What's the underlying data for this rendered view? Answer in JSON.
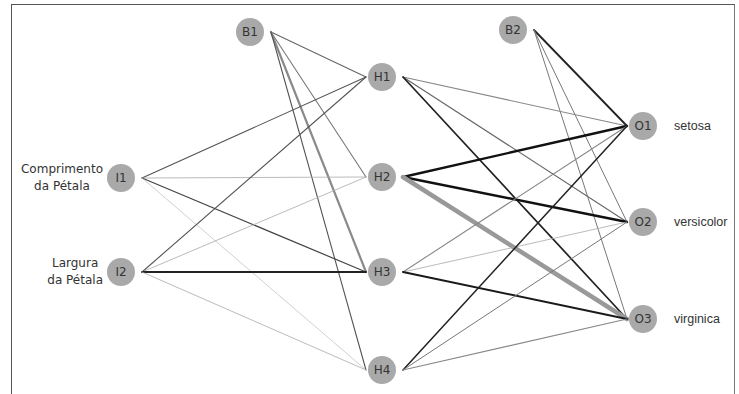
{
  "diagram": {
    "type": "neural-network",
    "nodes": {
      "B1": {
        "label": "B1",
        "x": 250,
        "y": 32
      },
      "B2": {
        "label": "B2",
        "x": 513,
        "y": 30
      },
      "I1": {
        "label": "I1",
        "x": 121,
        "y": 178
      },
      "I2": {
        "label": "I2",
        "x": 121,
        "y": 272
      },
      "H1": {
        "label": "H1",
        "x": 382,
        "y": 77
      },
      "H2": {
        "label": "H2",
        "x": 382,
        "y": 177
      },
      "H3": {
        "label": "H3",
        "x": 382,
        "y": 272
      },
      "H4": {
        "label": "H4",
        "x": 382,
        "y": 370
      },
      "O1": {
        "label": "O1",
        "x": 643,
        "y": 126
      },
      "O2": {
        "label": "O2",
        "x": 643,
        "y": 222
      },
      "O3": {
        "label": "O3",
        "x": 643,
        "y": 319
      }
    },
    "input_labels": {
      "I1": [
        "Comprimento",
        "da Pétala"
      ],
      "I2": [
        "Largura",
        "da Pétala"
      ]
    },
    "output_labels": {
      "O1": "setosa",
      "O2": "versicolor",
      "O3": "virginica"
    },
    "edges": [
      {
        "from": "B1",
        "to": "H1",
        "width": 1.1,
        "color": "#666666"
      },
      {
        "from": "B1",
        "to": "H2",
        "width": 1.1,
        "color": "#777777"
      },
      {
        "from": "B1",
        "to": "H3",
        "width": 2.2,
        "color": "#8a8a8a"
      },
      {
        "from": "B1",
        "to": "H4",
        "width": 1.1,
        "color": "#555555"
      },
      {
        "from": "I1",
        "to": "H1",
        "width": 1.1,
        "color": "#555555"
      },
      {
        "from": "I1",
        "to": "H2",
        "width": 0.8,
        "color": "#aaaaaa"
      },
      {
        "from": "I1",
        "to": "H3",
        "width": 1.2,
        "color": "#444444"
      },
      {
        "from": "I1",
        "to": "H4",
        "width": 0.7,
        "color": "#bbbbbb"
      },
      {
        "from": "I2",
        "to": "H1",
        "width": 1.1,
        "color": "#555555"
      },
      {
        "from": "I2",
        "to": "H2",
        "width": 0.8,
        "color": "#aaaaaa"
      },
      {
        "from": "I2",
        "to": "H3",
        "width": 1.8,
        "color": "#222222"
      },
      {
        "from": "I2",
        "to": "H4",
        "width": 0.8,
        "color": "#aaaaaa"
      },
      {
        "from": "B2",
        "to": "O1",
        "width": 1.8,
        "color": "#222222"
      },
      {
        "from": "B2",
        "to": "O2",
        "width": 1.0,
        "color": "#777777"
      },
      {
        "from": "B2",
        "to": "O3",
        "width": 1.0,
        "color": "#777777"
      },
      {
        "from": "H1",
        "to": "O1",
        "width": 1.1,
        "color": "#888888"
      },
      {
        "from": "H1",
        "to": "O2",
        "width": 1.1,
        "color": "#666666"
      },
      {
        "from": "H1",
        "to": "O3",
        "width": 1.7,
        "color": "#222222"
      },
      {
        "from": "H2",
        "to": "O1",
        "width": 2.4,
        "color": "#111111"
      },
      {
        "from": "H2",
        "to": "O2",
        "width": 2.4,
        "color": "#111111"
      },
      {
        "from": "H2",
        "to": "O3",
        "width": 4.5,
        "color": "#999999"
      },
      {
        "from": "H3",
        "to": "O1",
        "width": 1.1,
        "color": "#888888"
      },
      {
        "from": "H3",
        "to": "O2",
        "width": 0.8,
        "color": "#aaaaaa"
      },
      {
        "from": "H3",
        "to": "O3",
        "width": 2.0,
        "color": "#1a1a1a"
      },
      {
        "from": "H4",
        "to": "O1",
        "width": 1.5,
        "color": "#222222"
      },
      {
        "from": "H4",
        "to": "O2",
        "width": 1.0,
        "color": "#777777"
      },
      {
        "from": "H4",
        "to": "O3",
        "width": 1.1,
        "color": "#888888"
      }
    ],
    "node_color": "#a9a9a9",
    "node_radius": 14
  }
}
